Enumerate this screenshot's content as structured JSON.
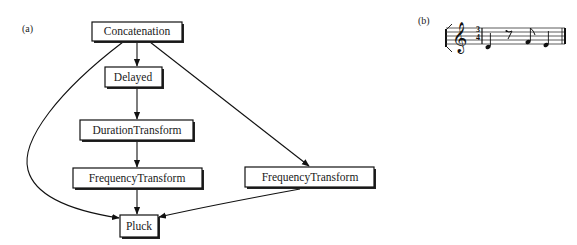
{
  "panels": {
    "a": "(a)",
    "b": "(b)"
  },
  "graph": {
    "nodes": [
      {
        "id": "concat",
        "label": "Concatenation"
      },
      {
        "id": "delayed",
        "label": "Delayed"
      },
      {
        "id": "duration",
        "label": "DurationTransform"
      },
      {
        "id": "freq_left",
        "label": "FrequencyTransform"
      },
      {
        "id": "freq_right",
        "label": "FrequencyTransform"
      },
      {
        "id": "pluck",
        "label": "Pluck"
      }
    ],
    "edges": [
      {
        "from": "concat",
        "to": "delayed"
      },
      {
        "from": "delayed",
        "to": "duration"
      },
      {
        "from": "duration",
        "to": "freq_left"
      },
      {
        "from": "freq_left",
        "to": "pluck"
      },
      {
        "from": "concat",
        "to": "freq_right"
      },
      {
        "from": "freq_right",
        "to": "pluck"
      },
      {
        "from": "concat",
        "to": "pluck"
      }
    ]
  },
  "score": {
    "clef": "treble",
    "time_signature": {
      "top": "3",
      "bottom": "4"
    },
    "notes": [
      "quarter",
      "eighth-rest",
      "eighth",
      "quarter"
    ]
  }
}
